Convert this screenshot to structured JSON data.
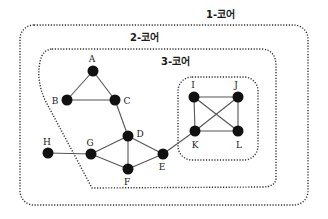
{
  "diagram": {
    "type": "k-core decomposition graph",
    "cores": [
      {
        "id": "core1",
        "label": "1-코어",
        "label_pos": [
          206,
          18
        ],
        "shape": "rect",
        "x": 20,
        "y": 25,
        "w": 288,
        "h": 180,
        "rx": 14
      },
      {
        "id": "core2",
        "label": "2-코어",
        "label_pos": [
          130,
          41
        ],
        "shape": "path",
        "d": "M 52 49 L 262 49 Q 276 50 276 66 L 276 178 Q 276 187 262 187 L 92 188 L 45 100 Q 36 80 40 62 Q 42 50 52 49 Z"
      },
      {
        "id": "core3",
        "label": "3-코어",
        "label_pos": [
          161,
          65
        ],
        "shape": "rect",
        "x": 178,
        "y": 77,
        "w": 80,
        "h": 83,
        "rx": 14
      }
    ],
    "nodes": [
      {
        "id": "A",
        "x": 93,
        "y": 71,
        "lx": 92,
        "ly": 62,
        "anchor": "middle"
      },
      {
        "id": "B",
        "x": 67,
        "y": 100,
        "lx": 55,
        "ly": 104,
        "anchor": "middle"
      },
      {
        "id": "C",
        "x": 115,
        "y": 100,
        "lx": 127,
        "ly": 104,
        "anchor": "middle"
      },
      {
        "id": "D",
        "x": 128,
        "y": 136,
        "lx": 140,
        "ly": 137,
        "anchor": "middle"
      },
      {
        "id": "E",
        "x": 163,
        "y": 154,
        "lx": 162,
        "ly": 170,
        "anchor": "middle"
      },
      {
        "id": "F",
        "x": 128,
        "y": 169,
        "lx": 127,
        "ly": 185,
        "anchor": "middle"
      },
      {
        "id": "G",
        "x": 91,
        "y": 154,
        "lx": 90,
        "ly": 146,
        "anchor": "middle"
      },
      {
        "id": "H",
        "x": 48,
        "y": 153,
        "lx": 47,
        "ly": 145,
        "anchor": "middle"
      },
      {
        "id": "I",
        "x": 194,
        "y": 97,
        "lx": 193,
        "ly": 88,
        "anchor": "middle"
      },
      {
        "id": "J",
        "x": 238,
        "y": 97,
        "lx": 236,
        "ly": 88,
        "anchor": "middle"
      },
      {
        "id": "K",
        "x": 195,
        "y": 131,
        "lx": 195,
        "ly": 148,
        "anchor": "middle"
      },
      {
        "id": "L",
        "x": 238,
        "y": 131,
        "lx": 239,
        "ly": 148,
        "anchor": "middle"
      }
    ],
    "edges": [
      [
        "A",
        "B"
      ],
      [
        "A",
        "C"
      ],
      [
        "B",
        "C"
      ],
      [
        "C",
        "D"
      ],
      [
        "D",
        "G"
      ],
      [
        "D",
        "F"
      ],
      [
        "D",
        "E"
      ],
      [
        "G",
        "F"
      ],
      [
        "F",
        "E"
      ],
      [
        "H",
        "G"
      ],
      [
        "E",
        "K"
      ],
      [
        "I",
        "J"
      ],
      [
        "I",
        "K"
      ],
      [
        "I",
        "L"
      ],
      [
        "J",
        "K"
      ],
      [
        "J",
        "L"
      ],
      [
        "K",
        "L"
      ]
    ],
    "node_radius": 5.5,
    "colors": {
      "node": "#111111",
      "edge": "#555555",
      "boundary": "#333333",
      "text": "#1a1a1a",
      "background": "#ffffff"
    }
  }
}
